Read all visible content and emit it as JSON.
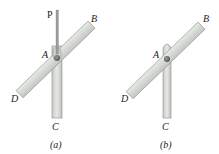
{
  "figure": {
    "panels": [
      {
        "id": "a",
        "caption": "(a)",
        "labels": {
          "P": "P",
          "A": "A",
          "B": "B",
          "C": "C",
          "D": "D"
        },
        "has_load_rod": true
      },
      {
        "id": "b",
        "caption": "(b)",
        "labels": {
          "A": "A",
          "B": "B",
          "C": "C",
          "D": "D"
        },
        "has_load_rod": false
      }
    ],
    "colors": {
      "bar_fill": "#d9dcd6",
      "bar_stroke": "#8a8d88",
      "pin": "#6b6e6a",
      "rod": "#9a9d99",
      "text": "#222222"
    }
  }
}
